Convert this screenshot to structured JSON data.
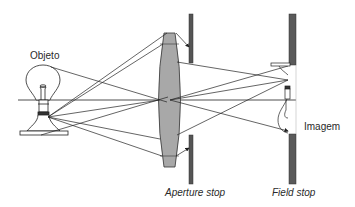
{
  "diagram": {
    "type": "optical-system",
    "labels": {
      "object": "Objeto",
      "aperture_stop": "Aperture stop",
      "field_stop": "Field stop",
      "image": "Imagem"
    },
    "colors": {
      "background": "#ffffff",
      "lens_fill": "#a8a8a8",
      "stop_fill": "#555555",
      "line": "#222222",
      "text": "#2a2a2a"
    },
    "elements": [
      {
        "id": "object",
        "kind": "light-bulb",
        "label": "Objeto"
      },
      {
        "id": "lens",
        "kind": "biconvex-lens"
      },
      {
        "id": "aperture-stop",
        "kind": "stop",
        "label": "Aperture stop"
      },
      {
        "id": "field-stop",
        "kind": "stop",
        "label": "Field stop"
      },
      {
        "id": "image",
        "kind": "inverted-bulb-image",
        "label": "Imagem"
      }
    ],
    "optical_axis": true
  }
}
